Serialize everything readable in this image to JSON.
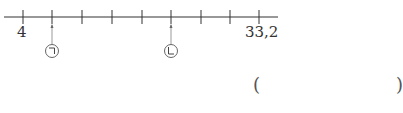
{
  "number_line": {
    "start_label": "4",
    "end_label": "33,2",
    "start_value": 4,
    "end_value": 33.2,
    "tick_count": 9,
    "tick_x": [
      23,
      52,
      82,
      112,
      142,
      171,
      201,
      230,
      259
    ],
    "line_color": "#333333"
  },
  "markers": [
    {
      "symbol": "㉠",
      "tick_index": 1
    },
    {
      "symbol": "㉡",
      "tick_index": 5
    }
  ],
  "answer_box": {
    "open": "(",
    "close": ")"
  }
}
